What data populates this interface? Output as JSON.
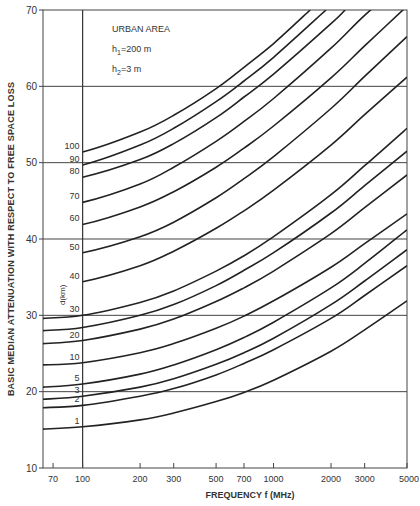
{
  "chart_data": {
    "type": "line",
    "title": "",
    "xlabel": "FREQUENCY f (MHz)",
    "ylabel": "BASIC MEDIAN ATTENUATION WITH RESPECT TO FREE SPACE LOSS",
    "xscale": "log",
    "xlim": [
      62,
      5000
    ],
    "ylim": [
      10,
      70
    ],
    "x_ticks": [
      70,
      100,
      200,
      300,
      500,
      700,
      1000,
      2000,
      3000,
      5000
    ],
    "x_tick_labels": [
      "70",
      "100",
      "200",
      "300",
      "500",
      "700",
      "1000",
      "2000",
      "3000",
      "5000"
    ],
    "y_ticks": [
      10,
      20,
      30,
      40,
      50,
      60,
      70
    ],
    "y_tick_labels": [
      "10",
      "20",
      "30",
      "40",
      "50",
      "60",
      "70"
    ],
    "grid": {
      "horizontal": [
        20,
        30,
        40,
        50,
        60
      ],
      "vertical": [
        100
      ]
    },
    "legend": {
      "title": "d(km)",
      "position": "inline-left"
    },
    "annotations": [
      "URBAN AREA",
      "h1=200 m",
      "h2=3 m"
    ],
    "x": [
      62,
      100,
      200,
      300,
      500,
      700,
      1000,
      2000,
      3000,
      5000
    ],
    "series": [
      {
        "name": "100",
        "label": "100",
        "values": [
          50.9,
          51.4,
          54.0,
          56.2,
          59.7,
          62.5,
          65.6,
          72.5,
          null,
          null
        ]
      },
      {
        "name": "90",
        "label": "90",
        "values": [
          49.2,
          49.7,
          52.3,
          54.5,
          58.0,
          60.7,
          63.8,
          70.6,
          null,
          null
        ]
      },
      {
        "name": "80",
        "label": "80",
        "values": [
          47.6,
          48.1,
          50.4,
          52.5,
          55.9,
          58.6,
          61.6,
          68.2,
          72.5,
          null
        ]
      },
      {
        "name": "70",
        "label": "70",
        "values": [
          44.2,
          44.8,
          47.2,
          49.4,
          52.8,
          55.4,
          58.4,
          65.0,
          69.3,
          74.0
        ]
      },
      {
        "name": "60",
        "label": "60",
        "values": [
          41.3,
          41.9,
          44.2,
          46.2,
          49.4,
          51.9,
          54.8,
          61.1,
          65.3,
          70.5
        ]
      },
      {
        "name": "50",
        "label": "50",
        "values": [
          37.7,
          38.2,
          40.3,
          42.2,
          45.4,
          47.9,
          50.8,
          57.1,
          61.3,
          66.5
        ]
      },
      {
        "name": "40",
        "label": "40",
        "values": [
          33.9,
          34.4,
          36.5,
          38.4,
          41.4,
          43.7,
          46.4,
          52.3,
          56.3,
          61.2
        ]
      },
      {
        "name": "30",
        "label": "30",
        "values": [
          29.6,
          30.0,
          31.7,
          33.2,
          35.8,
          37.8,
          40.3,
          45.8,
          49.6,
          54.5
        ]
      },
      {
        "name": "25",
        "label": "",
        "values": [
          28.0,
          28.4,
          30.0,
          31.4,
          33.9,
          35.9,
          38.2,
          43.4,
          47.0,
          51.5
        ]
      },
      {
        "name": "20",
        "label": "20",
        "values": [
          26.3,
          26.7,
          28.2,
          29.5,
          31.8,
          33.6,
          35.8,
          40.7,
          44.1,
          48.4
        ]
      },
      {
        "name": "10",
        "label": "10",
        "values": [
          23.5,
          23.8,
          25.1,
          26.3,
          28.3,
          29.9,
          31.9,
          36.3,
          39.4,
          43.3
        ]
      },
      {
        "name": "5",
        "label": "5",
        "values": [
          20.6,
          21.0,
          22.3,
          23.5,
          25.5,
          27.1,
          29.1,
          33.6,
          36.8,
          41.2
        ]
      },
      {
        "name": "3",
        "label": "3",
        "values": [
          19.0,
          19.4,
          20.6,
          21.7,
          23.6,
          25.1,
          27.0,
          31.4,
          34.5,
          38.6
        ]
      },
      {
        "name": "2",
        "label": "2",
        "values": [
          17.9,
          18.2,
          19.4,
          20.4,
          22.2,
          23.7,
          25.5,
          29.6,
          32.6,
          36.5
        ]
      },
      {
        "name": "1",
        "label": "1",
        "values": [
          15.1,
          15.4,
          16.3,
          17.2,
          18.7,
          19.9,
          21.5,
          25.3,
          28.1,
          31.9
        ]
      }
    ]
  }
}
